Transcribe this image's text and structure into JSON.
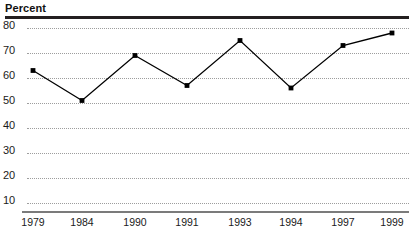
{
  "chart_data": {
    "type": "line",
    "title": "",
    "ylabel": "Percent",
    "xlabel": "",
    "categories": [
      "1979",
      "1984",
      "1990",
      "1991",
      "1993",
      "1994",
      "1997",
      "1999"
    ],
    "values": [
      63,
      51,
      69,
      57,
      75,
      56,
      73,
      78
    ],
    "series": [
      {
        "name": "Percent",
        "values": [
          63,
          51,
          69,
          57,
          75,
          56,
          73,
          78
        ]
      }
    ],
    "ylim": [
      5,
      82
    ],
    "yticks": [
      80,
      70,
      60,
      50,
      40,
      30,
      20,
      10
    ],
    "ytick_labels": [
      "80",
      "70",
      "60",
      "50",
      "40",
      "30",
      "20",
      "10"
    ],
    "grid": "horizontal-dotted",
    "legend": "none",
    "marker": "filled-square",
    "line_color": "#000000",
    "grid_color": "#9d9d9d",
    "rule_color": "#231f20",
    "axis_color": "#7b7b7b"
  },
  "header": {
    "axis_title": "Percent"
  }
}
